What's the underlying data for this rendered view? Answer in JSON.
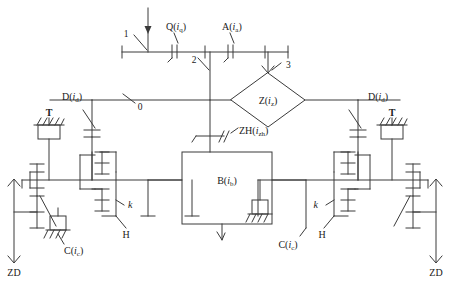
{
  "diagram": {
    "type": "mechanical-schematic",
    "stroke_color": "#3a3a3a",
    "background_color": "#ffffff",
    "nodes": {
      "engine_input": {
        "label": "1",
        "name": "input-shaft-node"
      },
      "pump": {
        "prefix": "Q",
        "var": "i",
        "sub": "q",
        "label": "Q(i_q)",
        "name": "pump-clutch"
      },
      "aux": {
        "prefix": "A",
        "var": "i",
        "sub": "a",
        "label": "A(i_a)",
        "name": "auxiliary-clutch"
      },
      "shaft2": {
        "label": "2",
        "name": "shaft-2-node"
      },
      "shaft3": {
        "label": "3",
        "name": "shaft-3-node"
      },
      "shaft0": {
        "label": "0",
        "name": "shaft-0-node"
      },
      "variator": {
        "prefix": "Z",
        "var": "i",
        "sub": "z",
        "label": "Z(i_z)",
        "name": "variator-unit"
      },
      "summing": {
        "prefix": "ZH",
        "var": "i",
        "sub": "zh",
        "label": "ZH(i_zh)",
        "name": "summing-clutch"
      },
      "gearbox": {
        "prefix": "B",
        "var": "i",
        "sub": "b",
        "label": "B(i_b)",
        "name": "main-gearbox"
      },
      "drive_left": {
        "prefix": "D",
        "var": "i",
        "sub": "d",
        "label": "D(i_d)",
        "name": "drive-clutch-left"
      },
      "drive_right": {
        "prefix": "D",
        "var": "i",
        "sub": "d",
        "label": "D(i_d)",
        "name": "drive-clutch-right"
      },
      "brake_left": {
        "label": "T",
        "name": "brake-left"
      },
      "brake_right": {
        "label": "T",
        "name": "brake-right"
      },
      "carrier_left": {
        "label": "H",
        "name": "planet-carrier-left"
      },
      "carrier_right": {
        "label": "H",
        "name": "planet-carrier-right"
      },
      "ratio_left": {
        "label": "k",
        "name": "gear-ratio-left"
      },
      "ratio_right": {
        "label": "k",
        "name": "gear-ratio-right"
      },
      "clutch_left": {
        "prefix": "C",
        "var": "i",
        "sub": "c",
        "label": "C(i_c)",
        "name": "side-clutch-left"
      },
      "clutch_right": {
        "prefix": "C",
        "var": "i",
        "sub": "c",
        "label": "C(i_c)",
        "name": "side-clutch-right"
      },
      "final_left": {
        "label": "ZD",
        "name": "final-drive-left"
      },
      "final_right": {
        "label": "ZD",
        "name": "final-drive-right"
      }
    }
  }
}
